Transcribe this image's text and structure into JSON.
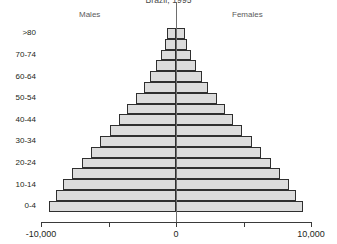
{
  "chart_data": {
    "type": "bar",
    "subtype": "population-pyramid",
    "title": "Brazil, 1995",
    "xlabel": "",
    "ylabel": "",
    "grid": false,
    "legend_position": "top",
    "legend": [
      "Males",
      "Females"
    ],
    "side_labels": {
      "left": "Males",
      "right": "Females"
    },
    "xlim": [
      -10000,
      10000
    ],
    "xticks": [
      -10000,
      -5000,
      0,
      5000,
      10000
    ],
    "xticklabels_shown": [
      "-10,000",
      "0",
      "10,000"
    ],
    "xticklabels": {
      "min": "-10,000",
      "center": "0",
      "max": "10,000"
    },
    "categories": [
      "0-4",
      "5-9",
      "10-14",
      "15-19",
      "20-24",
      "25-29",
      "30-34",
      "35-39",
      "40-44",
      "45-49",
      "50-54",
      "55-59",
      "60-64",
      "65-69",
      "70-74",
      "75-79",
      ">80"
    ],
    "ytick_labels_shown": [
      ">80",
      "70-74",
      "60-64",
      "50-54",
      "40-44",
      "30-34",
      "20-24",
      "10-14",
      "0-4"
    ],
    "series": [
      {
        "name": "Males",
        "direction": "left",
        "values": [
          9400,
          8900,
          8400,
          7700,
          7000,
          6300,
          5600,
          4900,
          4200,
          3600,
          3000,
          2400,
          1950,
          1500,
          1100,
          800,
          650
        ]
      },
      {
        "name": "Females",
        "direction": "right",
        "values": [
          9400,
          8900,
          8400,
          7700,
          7000,
          6300,
          5600,
          4900,
          4200,
          3600,
          3000,
          2400,
          1950,
          1500,
          1100,
          800,
          650
        ]
      }
    ],
    "bar_fill_color": "#dcdcdc",
    "bar_border_color": "#2f2f2f",
    "axis_color": "#3a3a3a",
    "bar_count_per_side": 17
  }
}
